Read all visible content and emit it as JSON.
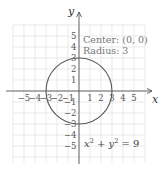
{
  "chart_data": {
    "type": "line",
    "title": "",
    "xlabel": "x",
    "ylabel": "y",
    "xlim": [
      -6,
      6
    ],
    "ylim": [
      -6,
      6
    ],
    "grid": true,
    "x_ticks": [
      -5,
      -4,
      -3,
      -2,
      -1,
      1,
      2,
      3,
      4,
      5
    ],
    "y_ticks": [
      5,
      4,
      3,
      2,
      1,
      -1,
      -2,
      -3,
      -4,
      -5
    ],
    "x_tick_labels": [
      "−5",
      "−4",
      "−3",
      "−2",
      "−1",
      "1",
      "2",
      "3",
      "4",
      "5"
    ],
    "y_tick_labels": [
      "5",
      "4",
      "3",
      "2",
      "1",
      "−1",
      "−2",
      "−3",
      "−4",
      "−5"
    ],
    "series": [
      {
        "name": "x² + y² = 9",
        "shape": "circle",
        "center": [
          0,
          0
        ],
        "radius": 3
      }
    ],
    "annotations": [
      {
        "text": "Center: (0, 0)",
        "position": [
          0.3,
          4.4
        ]
      },
      {
        "text": "Radius: 3",
        "position": [
          0.3,
          3.4
        ]
      },
      {
        "text": "x² + y² = 9",
        "position": [
          0.3,
          -4.5
        ]
      }
    ]
  },
  "labels": {
    "x_axis": "x",
    "y_axis": "y",
    "center": "Center: (0, 0)",
    "radius": "Radius: 3",
    "eq_x": "x",
    "eq_sq1": "2",
    "eq_plus": " + ",
    "eq_y": "y",
    "eq_sq2": "2",
    "eq_rhs": " = 9"
  },
  "colors": {
    "grid": "#dcdcdc",
    "axis": "#555555",
    "curve": "#555555",
    "text": "#777777"
  }
}
